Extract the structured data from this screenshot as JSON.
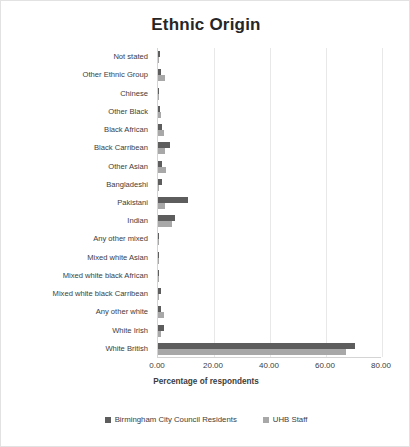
{
  "chart_data": {
    "type": "bar",
    "orientation": "horizontal",
    "title": "Ethnic Origin",
    "xlabel": "Percentage of respondents",
    "ylabel": "",
    "xlim": [
      0,
      80
    ],
    "xticks": [
      "0.00",
      "20.00",
      "40.00",
      "60.00",
      "80.00"
    ],
    "xtick_values": [
      0,
      20,
      40,
      60,
      80
    ],
    "grid": true,
    "legend_position": "bottom",
    "categories": [
      "Not stated",
      "Other Ethnic Group",
      "Chinese",
      "Other Black",
      "Black African",
      "Black Carribean",
      "Other Asian",
      "Bangladeshi",
      "Pakistani",
      "Indian",
      "Any other mixed",
      "Mixed white Asian",
      "Mixed white black African",
      "Mixed white black Carribean",
      "Any other white",
      "White Irish",
      "White British"
    ],
    "series": [
      {
        "name": "Birmingham City Council Residents",
        "color": "#5d5d5d",
        "values": [
          0.7,
          1.0,
          0.5,
          0.7,
          1.3,
          4.4,
          1.3,
          1.6,
          10.6,
          6.0,
          0.5,
          0.3,
          0.2,
          1.2,
          1.1,
          2.1,
          70.4
        ]
      },
      {
        "name": "UHB Staff",
        "color": "#a8a8a8",
        "values": [
          0.2,
          2.4,
          0.4,
          1.1,
          2.0,
          2.5,
          3.0,
          0.3,
          2.5,
          5.0,
          0.4,
          0.2,
          0.1,
          0.4,
          2.0,
          1.0,
          67.2
        ]
      }
    ]
  },
  "legend": {
    "items": [
      {
        "label": "Birmingham City Council Residents"
      },
      {
        "label": "UHB Staff"
      }
    ]
  }
}
